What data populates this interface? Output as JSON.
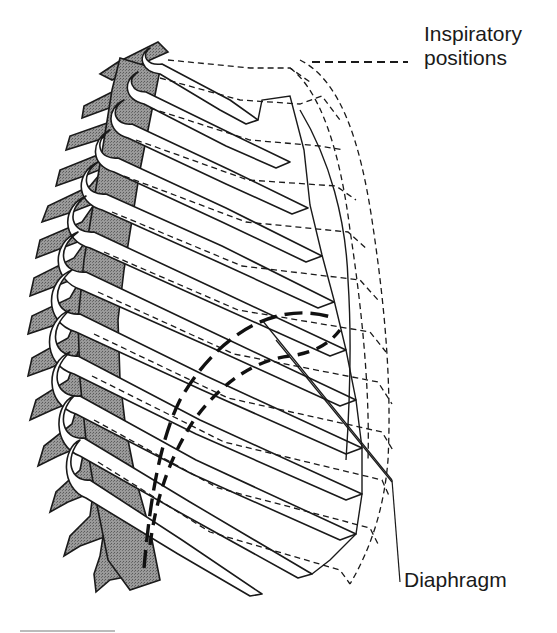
{
  "figure": {
    "legend": {
      "line_style": "dashed",
      "label_line1": "Inspiratory",
      "label_line2": "positions"
    },
    "annotations": {
      "diaphragm": "Diaphragm"
    },
    "colors": {
      "line": "#1a1a1a",
      "vertebrae_fill": "#8a8a8a",
      "rib_fill": "#ffffff",
      "background": "#ffffff"
    },
    "rib_count": 12
  }
}
